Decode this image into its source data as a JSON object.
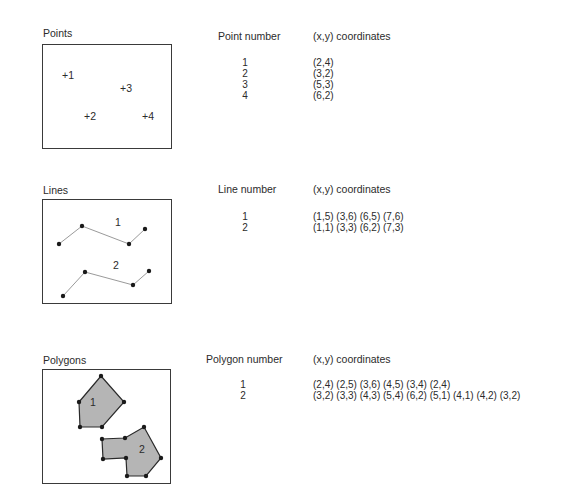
{
  "sections": {
    "points": {
      "title": "Points",
      "table_header_id": "Point number",
      "table_header_coords": "(x,y) coordinates",
      "rows": [
        {
          "id": "1",
          "coords": "(2,4)"
        },
        {
          "id": "2",
          "coords": "(3,2)"
        },
        {
          "id": "3",
          "coords": "(5,3)"
        },
        {
          "id": "4",
          "coords": "(6,2)"
        }
      ],
      "figure_labels": [
        "+1",
        "+2",
        "+3",
        "+4"
      ]
    },
    "lines": {
      "title": "Lines",
      "table_header_id": "Line number",
      "table_header_coords": "(x,y) coordinates",
      "rows": [
        {
          "id": "1",
          "coords": "(1,5) (3,6) (6,5) (7,6)"
        },
        {
          "id": "2",
          "coords": "(1,1) (3,3) (6,2) (7,3)"
        }
      ],
      "figure_labels": [
        "1",
        "2"
      ]
    },
    "polygons": {
      "title": "Polygons",
      "table_header_id": "Polygon number",
      "table_header_coords": "(x,y) coordinates",
      "rows": [
        {
          "id": "1",
          "coords": "(2,4) (2,5) (3,6) (4,5) (3,4) (2,4)"
        },
        {
          "id": "2",
          "coords": "(3,2) (3,3) (4,3) (5,4) (6,2) (5,1) (4,1) (4,2) (3,2)"
        }
      ],
      "figure_labels": [
        "1",
        "2"
      ]
    }
  },
  "colors": {
    "stroke": "#3a3a3a",
    "line": "#9a9a9a",
    "vertex": "#1a1a1a",
    "polygon_fill": "#b5b5b5"
  }
}
